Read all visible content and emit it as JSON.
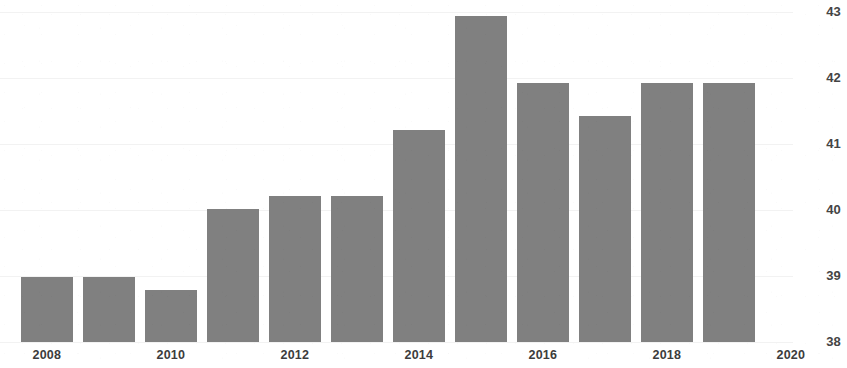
{
  "chart_data": {
    "type": "bar",
    "title": "",
    "subtitle": "",
    "xlabel": "",
    "ylabel": "",
    "categories": [
      "2008",
      "2009",
      "2010",
      "2011",
      "2012",
      "2013",
      "2014",
      "2015",
      "2016",
      "2017",
      "2018",
      "2019"
    ],
    "values": [
      38.98,
      38.98,
      38.79,
      40.02,
      40.21,
      40.21,
      41.21,
      42.94,
      41.92,
      41.42,
      41.92,
      41.92
    ],
    "series": [
      {
        "name": "",
        "values": [
          38.98,
          38.98,
          38.79,
          40.02,
          40.21,
          40.21,
          41.21,
          42.94,
          41.92,
          41.42,
          41.92,
          41.92
        ]
      }
    ],
    "ylim": [
      38,
      43
    ],
    "xlim": [
      "2008",
      "2020"
    ],
    "y_ticks": [
      38,
      39,
      40,
      41,
      42,
      43
    ],
    "y_tick_labels": [
      "38",
      "39",
      "40",
      "41",
      "42",
      "43"
    ],
    "x_ticks": [
      "2008",
      "2010",
      "2012",
      "2014",
      "2016",
      "2018",
      "2020"
    ],
    "x_tick_labels": [
      "2008",
      "2010",
      "2012",
      "2014",
      "2016",
      "2018",
      "2020"
    ],
    "y_axis_position": "right",
    "grid": false,
    "legend": false,
    "legend_position": "none",
    "bar_color": "#808080",
    "background_color": "#ffffff",
    "annotations": []
  },
  "axes": {
    "y_labels": [
      {
        "text": "43",
        "value": 43
      },
      {
        "text": "42",
        "value": 42
      },
      {
        "text": "41",
        "value": 41
      },
      {
        "text": "40",
        "value": 40
      },
      {
        "text": "39",
        "value": 39
      },
      {
        "text": "38",
        "value": 38
      }
    ],
    "x_labels": [
      {
        "text": "2008"
      },
      {
        "text": "2010"
      },
      {
        "text": "2012"
      },
      {
        "text": "2014"
      },
      {
        "text": "2016"
      },
      {
        "text": "2018"
      },
      {
        "text": "2020"
      }
    ]
  }
}
